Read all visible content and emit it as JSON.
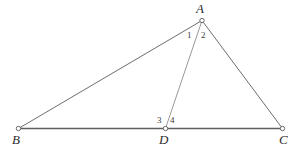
{
  "figure": {
    "kind": "geometry-diagram",
    "background_color": "#ffffff",
    "stroke_color": "#6d6d6d",
    "stroke_color_light": "#9a9a9a",
    "stroke_color_base": "#5e5e5e",
    "vertex_marker_fill": "#ffffff",
    "vertex_marker_stroke": "#5a5a5a",
    "label_color": "#2b2b2b",
    "angle_label_color": "#3a3a3a",
    "canvas": {
      "width": 301,
      "height": 151
    }
  },
  "points": [
    {
      "id": "A",
      "label": "A",
      "x": 202,
      "y": 20.5,
      "label_x": 196,
      "label_y": 2
    },
    {
      "id": "B",
      "label": "B",
      "x": 18.5,
      "y": 128.5,
      "label_x": 12,
      "label_y": 133
    },
    {
      "id": "C",
      "label": "C",
      "x": 282.5,
      "y": 128.5,
      "label_x": 279,
      "label_y": 133
    },
    {
      "id": "D",
      "label": "D",
      "x": 165.5,
      "y": 128.5,
      "label_x": 159,
      "label_y": 133
    }
  ],
  "segments": [
    {
      "id": "AB",
      "from": "B",
      "to": "A",
      "name": "segment-ab",
      "color": "#6d6d6d",
      "width": 1.0
    },
    {
      "id": "AC",
      "from": "A",
      "to": "C",
      "name": "segment-ac",
      "color": "#6d6d6d",
      "width": 1.0
    },
    {
      "id": "BC",
      "from": "B",
      "to": "C",
      "name": "segment-bc",
      "color": "#5e5e5e",
      "width": 1.4
    },
    {
      "id": "AD",
      "from": "A",
      "to": "D",
      "name": "segment-ad",
      "color": "#9a9a9a",
      "width": 1.0
    }
  ],
  "angle_labels": [
    {
      "id": "1",
      "label": "1",
      "at": "A",
      "x": 187,
      "y": 31
    },
    {
      "id": "2",
      "label": "2",
      "at": "A",
      "x": 201,
      "y": 31
    },
    {
      "id": "3",
      "label": "3",
      "at": "D",
      "x": 157,
      "y": 116
    },
    {
      "id": "4",
      "label": "4",
      "at": "D",
      "x": 170,
      "y": 116
    }
  ]
}
